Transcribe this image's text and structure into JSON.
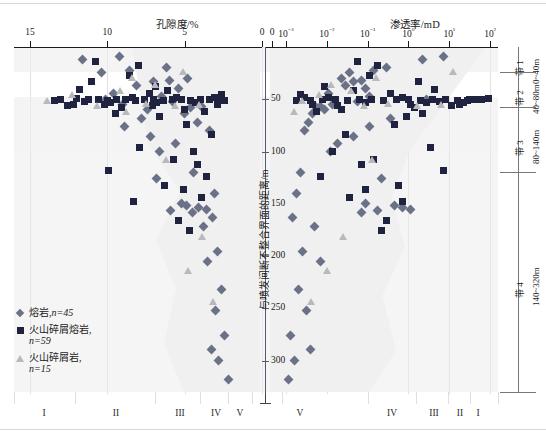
{
  "chart_data": {
    "type": "scatter",
    "title": "",
    "panels": [
      {
        "name": "porosity",
        "xlabel": "孔隙度/%",
        "xticks": [
          "15",
          "10",
          "5",
          "0"
        ],
        "xlim": [
          15,
          0
        ],
        "scale": "linear",
        "direction": "reversed"
      },
      {
        "name": "permeability",
        "xlabel": "渗透率/mD",
        "xticks": [
          "0",
          "10-3",
          "10-2",
          "10-1",
          "100",
          "101",
          "102"
        ],
        "xticks_display": [
          "0",
          "10⁻³",
          "10⁻²",
          "10⁻¹",
          "10⁰",
          "10¹",
          "10²"
        ],
        "xlim_exp": [
          -3,
          2
        ],
        "scale": "log"
      }
    ],
    "ylabel": "与喷发间断不整合界面的距离/m",
    "yticks": [
      50,
      100,
      150,
      200,
      250,
      300
    ],
    "ylim": [
      0,
      330
    ],
    "legend": [
      {
        "marker": "diamond",
        "label": "熔岩,",
        "n": "n=45",
        "color": "#6b7288"
      },
      {
        "marker": "square",
        "label": "火山碎屑熔岩,",
        "n": "n=59",
        "color": "#1f2340"
      },
      {
        "marker": "triangle",
        "label": "火山碎屑岩,",
        "n": "n=15",
        "color": "#b9b9bd"
      }
    ],
    "zones": [
      {
        "name": "带 1",
        "range": "0~40m"
      },
      {
        "name": "带 2",
        "range": "40~80m"
      },
      {
        "name": "带 3",
        "range": "80~140m"
      },
      {
        "name": "带 4",
        "range": "140~320m"
      }
    ],
    "quality_classes_left": [
      "I",
      "II",
      "III",
      "IV",
      "V"
    ],
    "quality_classes_right": [
      "V",
      "IV",
      "III",
      "II",
      "I"
    ],
    "series": [
      {
        "name": "熔岩",
        "marker": "diamond",
        "color": "#6b7288",
        "n": 45,
        "porosity": [
          [
            9.6,
            44
          ],
          [
            8.1,
            37
          ],
          [
            7.0,
            33
          ],
          [
            6.0,
            32
          ],
          [
            5.4,
            40
          ],
          [
            6.5,
            47
          ],
          [
            5.8,
            52
          ],
          [
            4.8,
            30
          ],
          [
            9.0,
            55
          ],
          [
            7.4,
            60
          ],
          [
            10.4,
            24
          ],
          [
            8.6,
            22
          ],
          [
            6.2,
            20
          ],
          [
            11.6,
            12
          ],
          [
            9.2,
            9
          ],
          [
            4.6,
            58
          ],
          [
            5.0,
            64
          ],
          [
            3.9,
            57
          ],
          [
            7.8,
            68
          ],
          [
            4.2,
            72
          ],
          [
            3.4,
            80
          ],
          [
            5.6,
            92
          ],
          [
            4.4,
            120
          ],
          [
            6.8,
            126
          ],
          [
            3.1,
            140
          ],
          [
            5.2,
            150
          ],
          [
            4.9,
            152
          ],
          [
            4.1,
            153
          ],
          [
            3.6,
            155
          ],
          [
            5.9,
            156
          ],
          [
            4.5,
            158
          ],
          [
            3.2,
            163
          ],
          [
            3.8,
            172
          ],
          [
            2.9,
            196
          ],
          [
            3.5,
            205
          ],
          [
            2.6,
            232
          ],
          [
            3.0,
            252
          ],
          [
            2.4,
            276
          ],
          [
            3.3,
            289
          ],
          [
            2.8,
            300
          ],
          [
            2.2,
            318
          ],
          [
            6.6,
            100
          ],
          [
            7.2,
            86
          ],
          [
            8.9,
            76
          ],
          [
            10.1,
            50
          ]
        ],
        "permeability": [
          [
            -1.95,
            44
          ],
          [
            -1.55,
            37
          ],
          [
            -1.35,
            33
          ],
          [
            -1.15,
            32
          ],
          [
            -1.05,
            40
          ],
          [
            -0.95,
            47
          ],
          [
            -1.25,
            52
          ],
          [
            -1.65,
            30
          ],
          [
            -1.85,
            55
          ],
          [
            -2.05,
            60
          ],
          [
            -1.45,
            24
          ],
          [
            -0.85,
            22
          ],
          [
            -0.55,
            20
          ],
          [
            0.35,
            12
          ],
          [
            0.85,
            9
          ],
          [
            -2.25,
            58
          ],
          [
            -2.35,
            64
          ],
          [
            -2.15,
            57
          ],
          [
            -0.45,
            68
          ],
          [
            -2.45,
            72
          ],
          [
            -2.55,
            80
          ],
          [
            -1.75,
            92
          ],
          [
            -2.65,
            120
          ],
          [
            -0.65,
            126
          ],
          [
            -2.75,
            140
          ],
          [
            -1.05,
            150
          ],
          [
            -0.35,
            152
          ],
          [
            -0.15,
            153
          ],
          [
            0.05,
            155
          ],
          [
            -0.75,
            156
          ],
          [
            -1.15,
            158
          ],
          [
            -2.85,
            163
          ],
          [
            -2.3,
            172
          ],
          [
            -2.6,
            196
          ],
          [
            -2.15,
            205
          ],
          [
            -2.7,
            232
          ],
          [
            -2.5,
            252
          ],
          [
            -2.9,
            276
          ],
          [
            -2.4,
            289
          ],
          [
            -2.8,
            300
          ],
          [
            -2.95,
            318
          ],
          [
            -1.9,
            100
          ],
          [
            -1.35,
            86
          ],
          [
            -0.95,
            76
          ],
          [
            0.45,
            50
          ]
        ]
      },
      {
        "name": "火山碎屑熔岩",
        "marker": "square",
        "color": "#1f2340",
        "n": 59,
        "porosity": [
          [
            11.2,
            50
          ],
          [
            10.6,
            50
          ],
          [
            10.0,
            51
          ],
          [
            9.4,
            50
          ],
          [
            8.8,
            50
          ],
          [
            8.2,
            51
          ],
          [
            7.6,
            50
          ],
          [
            7.0,
            50
          ],
          [
            6.4,
            51
          ],
          [
            5.8,
            50
          ],
          [
            5.2,
            50
          ],
          [
            4.6,
            51
          ],
          [
            4.0,
            50
          ],
          [
            3.4,
            50
          ],
          [
            2.8,
            51
          ],
          [
            12.0,
            49
          ],
          [
            11.5,
            52
          ],
          [
            9.8,
            53
          ],
          [
            8.4,
            48
          ],
          [
            6.8,
            53
          ],
          [
            5.5,
            48
          ],
          [
            4.3,
            53
          ],
          [
            3.1,
            48
          ],
          [
            2.4,
            51
          ],
          [
            13.0,
            50
          ],
          [
            7.3,
            44
          ],
          [
            6.1,
            42
          ],
          [
            9.1,
            58
          ],
          [
            5.0,
            60
          ],
          [
            3.7,
            62
          ],
          [
            12.6,
            56
          ],
          [
            11.0,
            33
          ],
          [
            8.0,
            18
          ],
          [
            10.8,
            14
          ],
          [
            6.6,
            66
          ],
          [
            4.9,
            74
          ],
          [
            3.3,
            84
          ],
          [
            7.9,
            96
          ],
          [
            5.7,
            108
          ],
          [
            4.2,
            112
          ],
          [
            9.9,
            118
          ],
          [
            6.3,
            132
          ],
          [
            3.9,
            144
          ],
          [
            5.4,
            166
          ],
          [
            4.7,
            175
          ],
          [
            12.2,
            55
          ],
          [
            10.2,
            55
          ],
          [
            2.9,
            55
          ],
          [
            7.1,
            56
          ],
          [
            8.6,
            27
          ],
          [
            11.8,
            41
          ],
          [
            13.4,
            51
          ],
          [
            2.6,
            45
          ],
          [
            6.9,
            38
          ],
          [
            9.5,
            64
          ],
          [
            4.4,
            100
          ],
          [
            3.6,
            124
          ],
          [
            5.1,
            136
          ],
          [
            8.3,
            148
          ]
        ],
        "permeability": [
          [
            0.9,
            50
          ],
          [
            0.6,
            50
          ],
          [
            0.3,
            51
          ],
          [
            0.0,
            50
          ],
          [
            -0.3,
            50
          ],
          [
            -0.6,
            51
          ],
          [
            -0.9,
            50
          ],
          [
            -1.2,
            50
          ],
          [
            -1.5,
            51
          ],
          [
            -1.8,
            50
          ],
          [
            -2.1,
            50
          ],
          [
            1.2,
            51
          ],
          [
            1.5,
            50
          ],
          [
            1.8,
            50
          ],
          [
            -2.4,
            51
          ],
          [
            1.95,
            49
          ],
          [
            0.75,
            52
          ],
          [
            0.45,
            53
          ],
          [
            -0.15,
            48
          ],
          [
            -1.05,
            53
          ],
          [
            -1.95,
            48
          ],
          [
            1.35,
            53
          ],
          [
            -2.55,
            48
          ],
          [
            -2.75,
            51
          ],
          [
            1.65,
            50
          ],
          [
            -0.45,
            44
          ],
          [
            -1.35,
            42
          ],
          [
            0.15,
            58
          ],
          [
            -1.65,
            60
          ],
          [
            -2.25,
            62
          ],
          [
            1.05,
            56
          ],
          [
            0.25,
            33
          ],
          [
            -0.75,
            18
          ],
          [
            -1.25,
            14
          ],
          [
            -0.05,
            66
          ],
          [
            -0.35,
            74
          ],
          [
            -1.55,
            84
          ],
          [
            0.55,
            96
          ],
          [
            -0.85,
            108
          ],
          [
            -1.15,
            112
          ],
          [
            0.85,
            118
          ],
          [
            -0.25,
            132
          ],
          [
            -1.45,
            144
          ],
          [
            -0.55,
            166
          ],
          [
            -0.65,
            175
          ],
          [
            1.25,
            55
          ],
          [
            0.05,
            55
          ],
          [
            -2.35,
            55
          ],
          [
            -1.75,
            56
          ],
          [
            -0.95,
            27
          ],
          [
            0.65,
            41
          ],
          [
            1.45,
            51
          ],
          [
            -2.65,
            45
          ],
          [
            -2.05,
            38
          ],
          [
            0.35,
            64
          ],
          [
            -1.85,
            100
          ],
          [
            -2.15,
            124
          ],
          [
            -1.05,
            136
          ],
          [
            -0.15,
            148
          ]
        ]
      },
      {
        "name": "火山碎屑岩",
        "marker": "triangle",
        "color": "#b9b9bd",
        "n": 15,
        "porosity": [
          [
            9.2,
            42
          ],
          [
            8.4,
            30
          ],
          [
            6.9,
            36
          ],
          [
            13.9,
            52
          ],
          [
            12.3,
            46
          ],
          [
            10.7,
            56
          ],
          [
            7.5,
            54
          ],
          [
            5.6,
            56
          ],
          [
            4.1,
            55
          ],
          [
            6.2,
            108
          ],
          [
            3.9,
            182
          ],
          [
            4.8,
            214
          ],
          [
            3.2,
            244
          ],
          [
            8.8,
            62
          ],
          [
            5.1,
            24
          ]
        ],
        "permeability": [
          [
            -1.4,
            42
          ],
          [
            -0.8,
            30
          ],
          [
            -1.9,
            36
          ],
          [
            -2.6,
            52
          ],
          [
            -2.2,
            46
          ],
          [
            -1.1,
            56
          ],
          [
            -0.5,
            54
          ],
          [
            0.2,
            56
          ],
          [
            0.8,
            55
          ],
          [
            -0.9,
            108
          ],
          [
            -1.6,
            182
          ],
          [
            -2.0,
            214
          ],
          [
            -2.4,
            244
          ],
          [
            -2.8,
            62
          ],
          [
            1.1,
            24
          ]
        ]
      }
    ]
  }
}
